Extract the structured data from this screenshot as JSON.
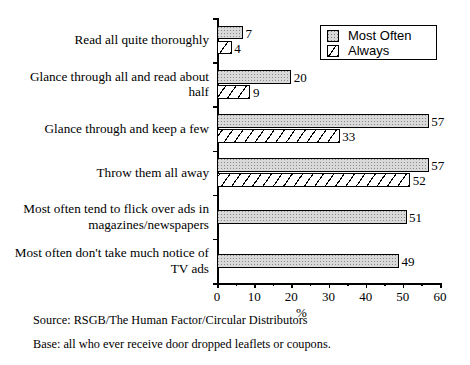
{
  "chart_data": {
    "type": "bar",
    "orientation": "horizontal",
    "title": "",
    "subtitle": "",
    "xlabel": "%",
    "ylabel": "",
    "xlim": [
      0,
      60
    ],
    "xticks": [
      0,
      10,
      20,
      30,
      40,
      50,
      60
    ],
    "xticklabels": [
      "0",
      "10",
      "20",
      "30",
      "40",
      "50",
      "60"
    ],
    "grid": false,
    "legend_position": "top-right",
    "categories": [
      "Read all quite thoroughly",
      "Glance through all and read about\nhalf",
      "Glance  through and keep a few",
      "Throw them  all away",
      "Most often  tend to flick over ads in\nmagazines/newspapers",
      "Most often don't take much notice of\nTV ads"
    ],
    "series": [
      {
        "name": "Most Often",
        "fill": "dotted-gray",
        "color": "#d9d9d9",
        "values": [
          7,
          20,
          57,
          57,
          51,
          49
        ],
        "labels": [
          "7",
          "20",
          "57",
          "57",
          "51",
          "49"
        ]
      },
      {
        "name": "Always",
        "fill": "diagonal-hatch",
        "color": "#ffffff",
        "values": [
          4,
          9,
          33,
          52,
          null,
          null
        ],
        "labels": [
          "4",
          "9",
          "33",
          "52",
          "",
          ""
        ]
      }
    ]
  },
  "legend": {
    "items": [
      {
        "label": "Most Often",
        "swatch": "dotted-gray-swatch"
      },
      {
        "label": "Always",
        "swatch": "diagonal-hatch-swatch"
      }
    ]
  },
  "axis": {
    "x_title": "%"
  },
  "footer": {
    "source": "Source: RSGB/The Human Factor/Circular Distributors",
    "base": "Base: all who ever receive door dropped leaflets or coupons."
  },
  "colors": {
    "most_often_fill": "#d9d9d9",
    "always_fill": "#ffffff",
    "outline": "#000000",
    "background": "#ffffff"
  }
}
